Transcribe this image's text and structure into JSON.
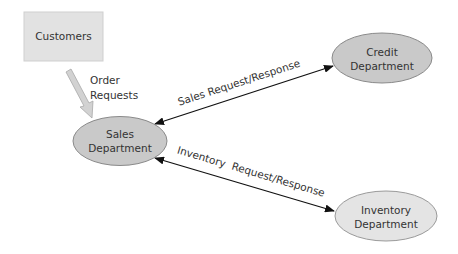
{
  "diagram": {
    "type": "data-flow",
    "nodes": [
      {
        "id": "customers",
        "shape": "rectangle",
        "lines": [
          "Customers"
        ],
        "fill": "#e2e2e2",
        "stroke": "#cfcfcf"
      },
      {
        "id": "sales",
        "shape": "ellipse",
        "lines": [
          "Sales",
          "Department"
        ],
        "fill": "#c9c9c9",
        "stroke": "#8a8a8a"
      },
      {
        "id": "credit",
        "shape": "ellipse",
        "lines": [
          "Credit",
          "Department"
        ],
        "fill": "#c9c9c9",
        "stroke": "#8a8a8a"
      },
      {
        "id": "inventory",
        "shape": "ellipse",
        "lines": [
          "Inventory",
          "Department"
        ],
        "fill": "#e4e4e4",
        "stroke": "#9a9a9a"
      }
    ],
    "edges": [
      {
        "id": "order-requests",
        "from": "customers",
        "to": "sales",
        "style": "block-arrow",
        "label_lines": [
          "Order",
          "Requests"
        ],
        "color": "#c8c8c8"
      },
      {
        "id": "sales-request-response",
        "from": "sales",
        "to": "credit",
        "style": "bidirectional",
        "label": "Sales Request/Response",
        "color": "#111111"
      },
      {
        "id": "inventory-request-response",
        "from": "sales",
        "to": "inventory",
        "style": "bidirectional",
        "label": "Inventory  Request/Response",
        "color": "#111111"
      }
    ]
  }
}
